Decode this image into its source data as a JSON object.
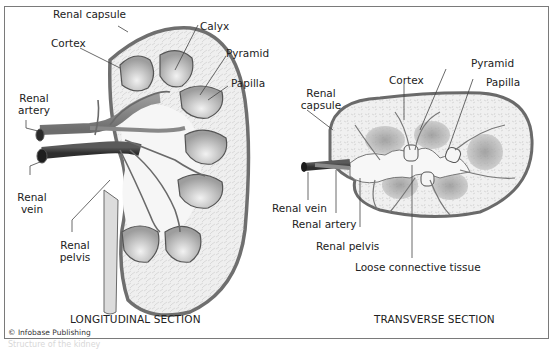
{
  "figure": {
    "copyright": "© Infobase Publishing",
    "ghost_caption": "Structure of the kidney"
  },
  "longitudinal": {
    "title": "LONGITUDINAL SECTION",
    "labels": {
      "renal_capsule": "Renal capsule",
      "cortex": "Cortex",
      "calyx": "Calyx",
      "pyramid": "Pyramid",
      "papilla": "Papilla",
      "renal_artery_1": "Renal",
      "renal_artery_2": "artery",
      "renal_vein_1": "Renal",
      "renal_vein_2": "vein",
      "renal_pelvis_1": "Renal",
      "renal_pelvis_2": "pelvis"
    }
  },
  "transverse": {
    "title": "TRANSVERSE SECTION",
    "labels": {
      "renal_capsule_1": "Renal",
      "renal_capsule_2": "capsule",
      "cortex": "Cortex",
      "pyramid": "Pyramid",
      "papilla": "Papilla",
      "renal_vein": "Renal vein",
      "renal_artery": "Renal artery",
      "renal_pelvis": "Renal pelvis",
      "loose_connective_tissue": "Loose connective tissue"
    }
  },
  "colors": {
    "capsule": "#6f6f6f",
    "cortex_fill": "#eeeeee",
    "pyramid_fill": "#b9b9b9",
    "vessel_artery": "#8c8c8c",
    "vessel_vein": "#4a4a4a",
    "pelvis_fill": "#f7f7f7",
    "leader_line": "#444444"
  }
}
